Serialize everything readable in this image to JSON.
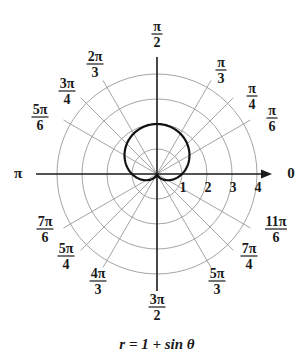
{
  "chart_data": {
    "type": "line",
    "subtype": "polar",
    "title": "r = 1 + sin θ",
    "equation": "r = 1 + sin θ",
    "radial_ticks": [
      "1",
      "2",
      "3",
      "4"
    ],
    "radial_range": [
      0,
      4
    ],
    "angle_labels": [
      {
        "angle_deg": 0,
        "label_num": "0",
        "label_den": ""
      },
      {
        "angle_deg": 30,
        "label_num": "π",
        "label_den": "6"
      },
      {
        "angle_deg": 45,
        "label_num": "π",
        "label_den": "4"
      },
      {
        "angle_deg": 60,
        "label_num": "π",
        "label_den": "3"
      },
      {
        "angle_deg": 90,
        "label_num": "π",
        "label_den": "2"
      },
      {
        "angle_deg": 120,
        "label_num": "2π",
        "label_den": "3"
      },
      {
        "angle_deg": 135,
        "label_num": "3π",
        "label_den": "4"
      },
      {
        "angle_deg": 150,
        "label_num": "5π",
        "label_den": "6"
      },
      {
        "angle_deg": 180,
        "label_num": "π",
        "label_den": ""
      },
      {
        "angle_deg": 210,
        "label_num": "7π",
        "label_den": "6"
      },
      {
        "angle_deg": 225,
        "label_num": "5π",
        "label_den": "4"
      },
      {
        "angle_deg": 240,
        "label_num": "4π",
        "label_den": "3"
      },
      {
        "angle_deg": 270,
        "label_num": "3π",
        "label_den": "2"
      },
      {
        "angle_deg": 300,
        "label_num": "5π",
        "label_den": "3"
      },
      {
        "angle_deg": 315,
        "label_num": "7π",
        "label_den": "4"
      },
      {
        "angle_deg": 330,
        "label_num": "11π",
        "label_den": "6"
      }
    ],
    "series": [
      {
        "name": "r = 1 + sin θ",
        "theta_range_deg": [
          0,
          360
        ],
        "points_theta_deg": [
          0,
          30,
          60,
          90,
          120,
          150,
          180,
          210,
          240,
          270,
          300,
          330,
          360
        ],
        "points_r": [
          1,
          1.5,
          1.87,
          2,
          1.87,
          1.5,
          1,
          0.5,
          0.13,
          0,
          0.13,
          0.5,
          1
        ]
      }
    ],
    "grid": true,
    "legend": "none"
  },
  "caption": "r = 1 + sin θ",
  "colors": {
    "curve": "#111111",
    "grid": "#9a9a9a",
    "axis": "#1a1a1a"
  }
}
